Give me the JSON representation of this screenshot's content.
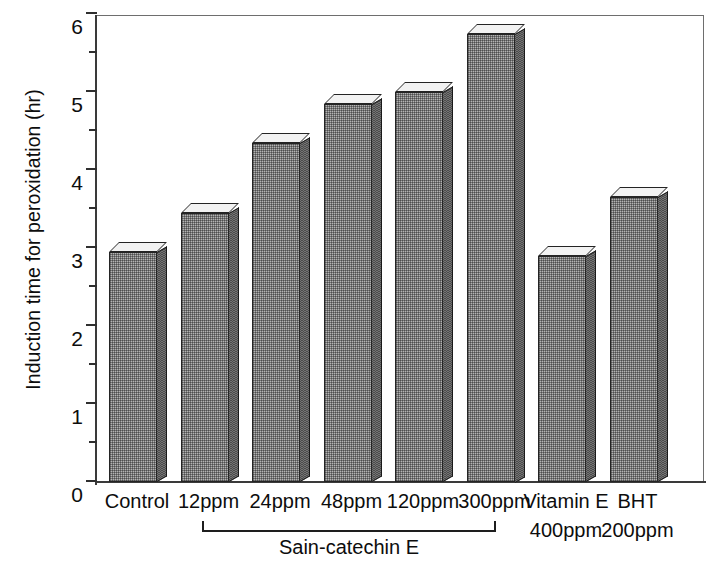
{
  "chart_data": {
    "type": "bar",
    "title": "",
    "xlabel": "",
    "ylabel": "Induction time for peroxidation  (hr)",
    "ylim": [
      0,
      6
    ],
    "y_major_ticks": [
      0,
      1,
      2,
      3,
      4,
      5,
      6
    ],
    "y_minor_ticks": [
      0.5,
      1.5,
      2.5,
      3.5,
      4.5,
      5.5
    ],
    "grid": false,
    "legend": null,
    "categories": [
      "Control",
      "12ppm",
      "24ppm",
      "48ppm",
      "120ppm",
      "300ppm",
      "Vitamin E",
      "BHT"
    ],
    "category_sublabels": [
      "",
      "",
      "",
      "",
      "",
      "",
      "400ppm",
      "200ppm"
    ],
    "values": [
      2.95,
      3.45,
      4.35,
      4.85,
      5.0,
      5.75,
      2.9,
      3.65
    ],
    "annotations": [
      {
        "type": "group-bracket",
        "label": "Sain-catechin E",
        "spans": [
          "12ppm",
          "24ppm",
          "48ppm",
          "120ppm",
          "300ppm"
        ]
      }
    ],
    "style": {
      "bar_fill": "#b3b3b3",
      "bar_side": "#4c4c4c",
      "bar_top": "#f2f2f2",
      "bar_outline": "#242424",
      "axis_color": "#3a3a3a",
      "background": "#ffffff",
      "three_d": true
    }
  },
  "axis": {
    "y_tick_labels": [
      "0",
      "1",
      "2",
      "3",
      "4",
      "5",
      "6"
    ]
  },
  "bracket": {
    "label": "Sain-catechin E"
  }
}
